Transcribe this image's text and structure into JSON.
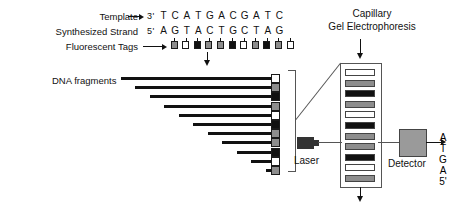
{
  "diagram": {
    "labels": {
      "template": "Template",
      "synthesized_strand": "Synthesized Strand",
      "fluorescent_tags": "Fluorescent Tags",
      "dna_fragments": "DNA fragments",
      "capillary_line1": "Capillary",
      "capillary_line2": "Gel Electrophoresis",
      "laser": "Laser",
      "detector": "Detector"
    },
    "template_strand": {
      "prime": "3'",
      "bases": [
        "T",
        "C",
        "A",
        "T",
        "G",
        "A",
        "C",
        "G",
        "A",
        "T",
        "C"
      ]
    },
    "synthesized_strand": {
      "prime": "5'",
      "bases": [
        "A",
        "G",
        "T",
        "A",
        "C",
        "T",
        "G",
        "C",
        "T",
        "A",
        "G"
      ]
    },
    "fluorescent_tags": [
      {
        "base": "A",
        "fill": "gray"
      },
      {
        "base": "G",
        "fill": "white"
      },
      {
        "base": "T",
        "fill": "black"
      },
      {
        "base": "A",
        "fill": "gray"
      },
      {
        "base": "C",
        "fill": "gray"
      },
      {
        "base": "T",
        "fill": "black"
      },
      {
        "base": "G",
        "fill": "white"
      },
      {
        "base": "C",
        "fill": "gray"
      },
      {
        "base": "T",
        "fill": "black"
      },
      {
        "base": "A",
        "fill": "gray"
      },
      {
        "base": "G",
        "fill": "white"
      }
    ],
    "fragments": [
      {
        "length": 11,
        "cap": "white"
      },
      {
        "length": 10,
        "cap": "gray"
      },
      {
        "length": 9,
        "cap": "black"
      },
      {
        "length": 8,
        "cap": "gray"
      },
      {
        "length": 7,
        "cap": "white"
      },
      {
        "length": 6,
        "cap": "black"
      },
      {
        "length": 5,
        "cap": "gray"
      },
      {
        "length": 4,
        "cap": "gray"
      },
      {
        "length": 3,
        "cap": "black"
      },
      {
        "length": 2,
        "cap": "white"
      },
      {
        "length": 1,
        "cap": "gray"
      }
    ],
    "gel_bands": [
      {
        "fill": "white"
      },
      {
        "fill": "gray"
      },
      {
        "fill": "black"
      },
      {
        "fill": "gray"
      },
      {
        "fill": "white"
      },
      {
        "fill": "black"
      },
      {
        "fill": "gray"
      },
      {
        "fill": "gray"
      },
      {
        "fill": "black"
      },
      {
        "fill": "white"
      },
      {
        "fill": "gray"
      }
    ],
    "output_sequence": [
      "A",
      "T",
      "G",
      "A",
      "5'"
    ],
    "colors": {
      "ink": "#111111",
      "gray_tag": "#8d8d8d",
      "white_tag": "#ffffff",
      "black_tag": "#111111",
      "detector_fill": "#9a9a9a",
      "outline": "#555555"
    }
  }
}
